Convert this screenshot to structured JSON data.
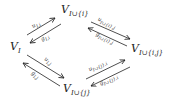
{
  "nodes": {
    "left": {
      "main": "V",
      "sub": "I"
    },
    "top": {
      "main": "V",
      "sub": "I∪{i}"
    },
    "right": {
      "main": "V",
      "sub": "I∪{i,j}"
    },
    "bottom": {
      "main": "V",
      "sub": "I∪{j}"
    }
  },
  "edges": {
    "left_top_u": "u",
    "left_top_u_sub": "I,i",
    "top_left_g": "g",
    "top_left_g_sub": "I,i",
    "top_right_u": "u",
    "top_right_u_sub": "I∪{i},j",
    "right_top_g": "g",
    "right_top_g_sub": "I∪{i},j",
    "left_bottom_u": "u",
    "left_bottom_u_sub": "I,j",
    "bottom_left_g": "g",
    "bottom_left_g_sub": "I,j",
    "bottom_right_u": "u",
    "bottom_right_u_sub": "I∪{j},i",
    "right_bottom_g": "g",
    "right_bottom_g_sub": "I∪{j},i"
  }
}
